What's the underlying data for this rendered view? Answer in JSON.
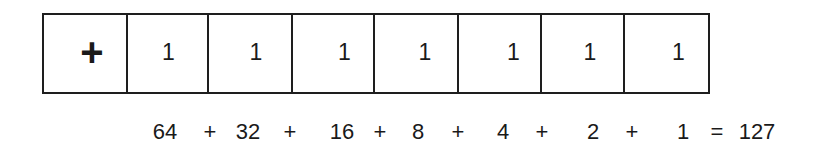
{
  "diagram": {
    "title": "",
    "register": {
      "cells": [
        {
          "label": "+",
          "role": "sign",
          "center_x": 48
        },
        {
          "label": "1",
          "role": "bit",
          "center_x": 41
        },
        {
          "label": "1",
          "role": "bit",
          "center_x": 47
        },
        {
          "label": "1",
          "role": "bit",
          "center_x": 52
        },
        {
          "label": "1",
          "role": "bit",
          "center_x": 50
        },
        {
          "label": "1",
          "role": "bit",
          "center_x": 55
        },
        {
          "label": "1",
          "role": "bit",
          "center_x": 48
        },
        {
          "label": "1",
          "role": "bit",
          "center_x": 54
        }
      ],
      "cell_widths": [
        84,
        82,
        84,
        83,
        84,
        84,
        83,
        84
      ]
    },
    "sum": {
      "terms": [
        {
          "text": "64",
          "x": 165
        },
        {
          "text": "+",
          "x": 210
        },
        {
          "text": "32",
          "x": 248
        },
        {
          "text": "+",
          "x": 290
        },
        {
          "text": "16",
          "x": 342
        },
        {
          "text": "+",
          "x": 380
        },
        {
          "text": "8",
          "x": 418
        },
        {
          "text": "+",
          "x": 458
        },
        {
          "text": "4",
          "x": 503
        },
        {
          "text": "+",
          "x": 542
        },
        {
          "text": "2",
          "x": 593
        },
        {
          "text": "+",
          "x": 632
        },
        {
          "text": "1",
          "x": 683
        },
        {
          "text": "=",
          "x": 717
        },
        {
          "text": "127",
          "x": 757
        }
      ]
    },
    "colors": {
      "line": "#1e1e1e",
      "text": "#1a1a1a",
      "background": "#ffffff"
    }
  }
}
